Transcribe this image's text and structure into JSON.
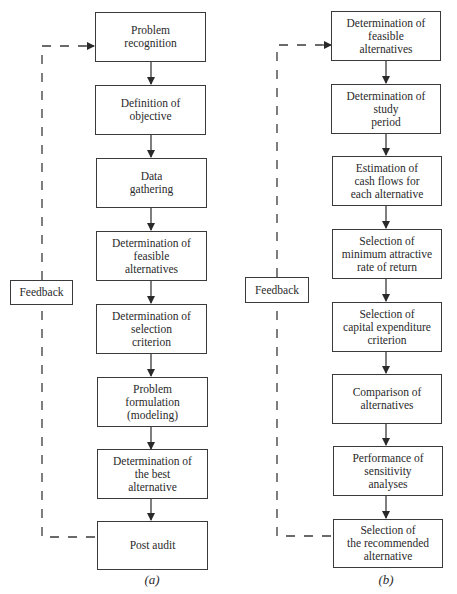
{
  "diagram_a": {
    "caption": "(a)",
    "feedback_label": "Feedback",
    "steps": [
      "Problem\nrecognition",
      "Definition of\nobjective",
      "Data\ngathering",
      "Determination of\nfeasible\nalternatives",
      "Determination of\nselection\ncriterion",
      "Problem\nformulation\n(modeling)",
      "Determination of\nthe best\nalternative",
      "Post audit"
    ]
  },
  "diagram_b": {
    "caption": "(b)",
    "feedback_label": "Feedback",
    "steps": [
      "Determination of\nfeasible\nalternatives",
      "Determination of\nstudy\nperiod",
      "Estimation of\ncash flows for\neach alternative",
      "Selection of\nminimum attractive\nrate of return",
      "Selection of\ncapital expenditure\ncriterion",
      "Comparison of\nalternatives",
      "Performance of\nsensitivity\nanalyses",
      "Selection of\nthe recommended\nalternative"
    ]
  },
  "colors": {
    "line": "#3a3a3a",
    "text": "#2a2a2a",
    "background": "#ffffff"
  }
}
